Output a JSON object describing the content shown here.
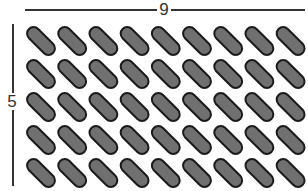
{
  "diagram": {
    "type": "array-of-pills",
    "columns": 9,
    "rows": 5,
    "width_label": "9",
    "height_label": "5",
    "pill_fill": "#707070",
    "pill_stroke": "#1a1a1a",
    "line_color": "#333333",
    "layout": {
      "origin_x": 41,
      "origin_y": 41,
      "pitch_x": 31.2,
      "pitch_y": 33,
      "pill_length": 34,
      "pill_width": 13,
      "angle_deg": 45
    }
  }
}
